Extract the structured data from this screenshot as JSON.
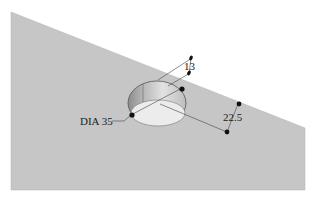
{
  "diagram": {
    "type": "isometric-part-drawing",
    "colors": {
      "background": "#ffffff",
      "surface": "#c8c8c8",
      "hole_wall_dark": "#9a9a9a",
      "hole_wall_light": "#dedede",
      "hole_floor": "#ececec",
      "line": "#333333",
      "dot": "#111111"
    },
    "dimensions": {
      "diameter_label": "DIA 35",
      "depth_label": "13",
      "offset_label": "22.5"
    }
  }
}
